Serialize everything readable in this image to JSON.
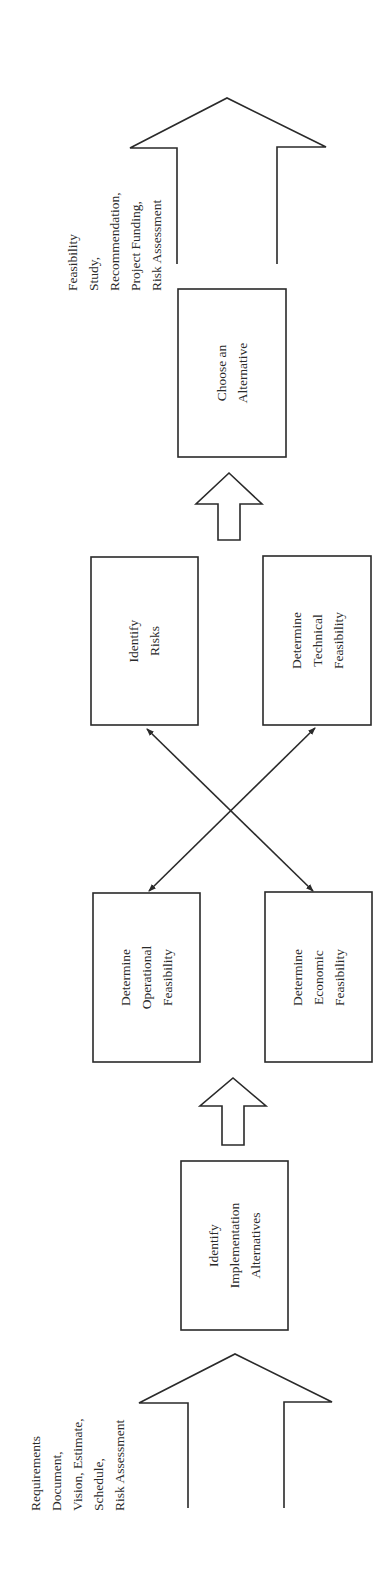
{
  "diagram": {
    "orientation": "rotated-90-ccw",
    "input": {
      "label_lines": [
        "Requirements",
        "Document,",
        "Vision, Estimate,",
        "Schedule,",
        "Risk Assessment"
      ]
    },
    "output": {
      "label_lines": [
        "Feasibility",
        "Study,",
        "Recommendation,",
        "Project Funding,",
        "Risk Assessment"
      ]
    },
    "boxes": {
      "identify_alternatives": {
        "lines": [
          "Identify",
          "Implementation",
          "Alternatives"
        ]
      },
      "operational": {
        "lines": [
          "Determine",
          "Operational",
          "Feasibility"
        ]
      },
      "economic": {
        "lines": [
          "Determine",
          "Economic",
          "Feasibility"
        ]
      },
      "risks": {
        "lines": [
          "Identify",
          "Risks"
        ]
      },
      "technical": {
        "lines": [
          "Determine",
          "Technical",
          "Feasibility"
        ]
      },
      "choose": {
        "lines": [
          "Choose an",
          "Alternative"
        ]
      }
    },
    "connections": [
      {
        "from": "input",
        "to": "identify_alternatives",
        "type": "large-block-arrow"
      },
      {
        "from": "identify_alternatives",
        "to": "operational/economic",
        "type": "small-block-arrow"
      },
      {
        "from": "operational",
        "to": "technical",
        "type": "double-headed-line"
      },
      {
        "from": "economic",
        "to": "risks",
        "type": "double-headed-line"
      },
      {
        "from": "risks/technical",
        "to": "choose",
        "type": "small-block-arrow"
      },
      {
        "from": "choose",
        "to": "output",
        "type": "large-block-arrow"
      }
    ],
    "colors": {
      "stroke": "#2a2a2a",
      "background": "#ffffff"
    }
  }
}
